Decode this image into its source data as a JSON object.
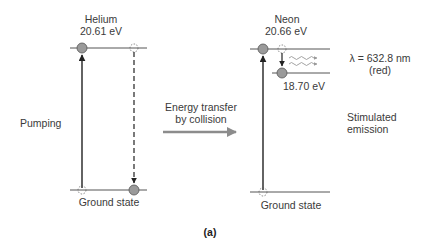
{
  "helium": {
    "name": "Helium",
    "energy": "20.61 eV",
    "ground_label": "Ground state"
  },
  "neon": {
    "name": "Neon",
    "energy": "20.66 eV",
    "lower_energy": "18.70 eV",
    "ground_label": "Ground state"
  },
  "labels": {
    "pumping": "Pumping",
    "transfer_line1": "Energy transfer",
    "transfer_line2": "by collision",
    "wavelength": "λ = 632.8 nm",
    "color": "(red)",
    "stimulated_line1": "Stimulated",
    "stimulated_line2": "emission",
    "caption": "(a)"
  },
  "colors": {
    "line": "#555555",
    "atom_fill": "#9a9a9a",
    "arrow_gray": "#8c8c8c"
  }
}
